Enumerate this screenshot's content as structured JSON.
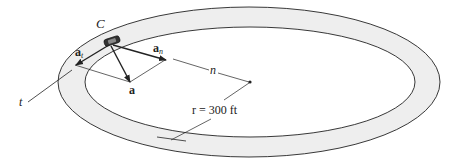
{
  "figure": {
    "labels": {
      "car": "C",
      "tangent_axis": "t",
      "normal_axis": "n",
      "total_accel": "a",
      "tangential_accel": "a",
      "tangential_sub": "t",
      "normal_accel": "a",
      "normal_sub": "n",
      "radius": "r = 300 ft"
    },
    "colors": {
      "track_fill": "#eeeeee",
      "line": "#222222",
      "background": "#ffffff"
    }
  }
}
